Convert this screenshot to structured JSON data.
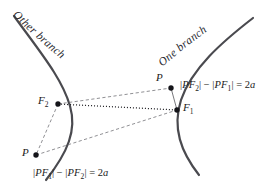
{
  "figure": {
    "type": "hyperbola-definition-diagram",
    "background_color": "#ffffff",
    "curve_color": "#4a4a4f",
    "line_color": "#6b6b70",
    "text_color": "#1b1b20"
  },
  "labels": {
    "other_branch": "Other branch",
    "one_branch": "One branch",
    "point_upper": "P",
    "point_lower": "P",
    "focus_right": "F",
    "focus_right_sub": "1",
    "focus_left": "F",
    "focus_left_sub": "2"
  },
  "equations": {
    "top": {
      "full": "|PF2| - |PF1| = 2a",
      "lhs_open": "|",
      "term1_var": "PF",
      "term1_sub": "2",
      "bar_close": "|",
      "minus": "−",
      "term2_var": "PF",
      "term2_sub": "1",
      "equals": "=",
      "rhs_num": "2",
      "rhs_var": "a"
    },
    "bottom": {
      "full": "|PF1| - |PF2| = 2a",
      "lhs_open": "|",
      "term1_var": "PF",
      "term1_sub": "1",
      "bar_close": "|",
      "minus": "−",
      "term2_var": "PF",
      "term2_sub": "2",
      "equals": "=",
      "rhs_num": "2",
      "rhs_var": "a"
    }
  },
  "geometry": {
    "focus_right": {
      "x": 177,
      "y": 110
    },
    "focus_left": {
      "x": 58,
      "y": 104
    },
    "point_upper": {
      "x": 171,
      "y": 88
    },
    "point_lower": {
      "x": 36,
      "y": 155
    },
    "left_branch_path": "M 14 16 C 40 52, 62 78, 70 106 C 77 130, 68 152, 46 180",
    "right_branch_path": "M 253 18 C 222 42, 192 68, 181 100 C 172 128, 181 152, 199 175",
    "dotted_axis": "M 58 104 L 177 110",
    "dashed_f2_to_upper_p": "M 58 104 L 171 88",
    "dashed_lower_p_to_f1": "M 36 155 L 177 110",
    "dashed_f2_to_lower_p": "M 58 104 L 36 155",
    "solid_upper_p_to_f1": "M 171 88 L 177 110"
  }
}
